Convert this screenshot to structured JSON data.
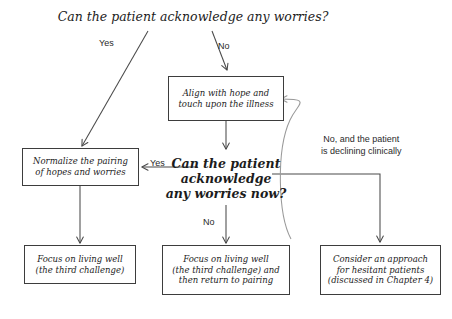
{
  "diagram": {
    "title": "Can the patient acknowledge any worries?",
    "nodes": {
      "align_hope": "Align with hope and\ntouch upon the illness",
      "normalize_pairing": "Normalize the pairing\nof hopes and worries",
      "decision_now": "Can the patient\nacknowledge\nany worries now?",
      "focus_living_well": "Focus on living well\n(the third challenge)",
      "focus_living_well_return": "Focus on living well\n(the third challenge) and\nthen return to pairing",
      "consider_approach": "Consider an approach\nfor hesitant patients\n(discussed in Chapter 4)"
    },
    "edge_labels": {
      "top_yes": "Yes",
      "top_no": "No",
      "decision_yes": "Yes",
      "decision_no": "No",
      "decision_declining": "No, and the patient\nis declining clinically"
    },
    "colors": {
      "line": "#4a4a4a",
      "curve": "#9a9a9a",
      "box_border": "#3d3d3d",
      "text": "#1c1c1c",
      "background": "#ffffff"
    }
  }
}
